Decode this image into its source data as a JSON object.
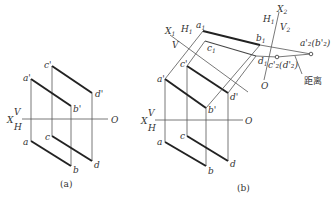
{
  "figure": {
    "panel_a": {
      "caption": "(a)",
      "axis": {
        "x_label": "X",
        "o_label": "O",
        "v_label": "V",
        "h_label": "H"
      },
      "points": {
        "a_prime": "a'",
        "b_prime": "b'",
        "c_prime": "c'",
        "d_prime": "d'",
        "a": "a",
        "b": "b",
        "c": "c",
        "d": "d"
      }
    },
    "panel_b": {
      "caption": "(b)",
      "axis": {
        "x_label": "X",
        "o_label": "O",
        "v_label": "V",
        "h_label": "H"
      },
      "aux_axis1": {
        "x_label": "X",
        "x_sub": "1",
        "h_label": "H",
        "h_sub": "1",
        "v_label": "V"
      },
      "aux_axis2": {
        "x_label": "X",
        "x_sub": "2",
        "h_label": "H",
        "h_sub": "1",
        "v_label": "V",
        "v_sub": "2",
        "o_label": "O"
      },
      "points": {
        "a_prime": "a'",
        "b_prime": "b'",
        "c_prime": "c'",
        "d_prime": "d'",
        "a": "a",
        "b": "b",
        "c": "c",
        "d": "d",
        "a1": "a",
        "a1_sub": "1",
        "b1": "b",
        "b1_sub": "1",
        "c1": "c",
        "c1_sub": "1",
        "d1": "d",
        "d1_sub": "1",
        "a2b2": "a'₂(b'₂)",
        "c2d2": "c'₂(d'₂)"
      },
      "annotation": "距离"
    }
  }
}
